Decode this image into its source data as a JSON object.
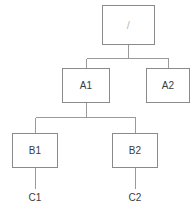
{
  "diagram": {
    "type": "tree",
    "style": {
      "background": "#ffffff",
      "box_fill": "#ffffff",
      "box_border": "#8a8a8a",
      "connector_color": "#9a9a9a",
      "text_color": "#3c3c3c",
      "root_text_color": "#b8b8b8"
    },
    "nodes": [
      {
        "id": "root",
        "label": "/",
        "shape": "box",
        "x": 102,
        "y": 5,
        "width": 53,
        "height": 40,
        "level": 0
      },
      {
        "id": "a1",
        "label": "A1",
        "shape": "box",
        "x": 62,
        "y": 68,
        "width": 48,
        "height": 35,
        "level": 1
      },
      {
        "id": "a2",
        "label": "A2",
        "shape": "box",
        "x": 146,
        "y": 68,
        "width": 44,
        "height": 35,
        "level": 1
      },
      {
        "id": "b1",
        "label": "B1",
        "shape": "box",
        "x": 12,
        "y": 133,
        "width": 46,
        "height": 35,
        "level": 2
      },
      {
        "id": "b2",
        "label": "B2",
        "shape": "box",
        "x": 112,
        "y": 133,
        "width": 46,
        "height": 35,
        "level": 2
      },
      {
        "id": "c1",
        "label": "C1",
        "shape": "text",
        "cx": 35,
        "cy": 198,
        "level": 3
      },
      {
        "id": "c2",
        "label": "C2",
        "shape": "text",
        "cx": 135,
        "cy": 198,
        "level": 3
      }
    ],
    "edges": [
      {
        "from": "root",
        "to": "a1"
      },
      {
        "from": "root",
        "to": "a2"
      },
      {
        "from": "a1",
        "to": "b1"
      },
      {
        "from": "a1",
        "to": "b2"
      },
      {
        "from": "b1",
        "to": "c1"
      },
      {
        "from": "b2",
        "to": "c2"
      }
    ],
    "connectors": {
      "root_bus_y": 58,
      "root_stub_x": 128,
      "root_bus_x1": 86,
      "root_bus_x2": 168,
      "a1_bus_y": 118,
      "a1_stub_x": 86,
      "a1_bus_x1": 35,
      "a1_bus_x2": 135,
      "c1_line_x": 35,
      "c2_line_x": 135,
      "c_line_y1": 168,
      "c_line_y2": 189
    }
  }
}
